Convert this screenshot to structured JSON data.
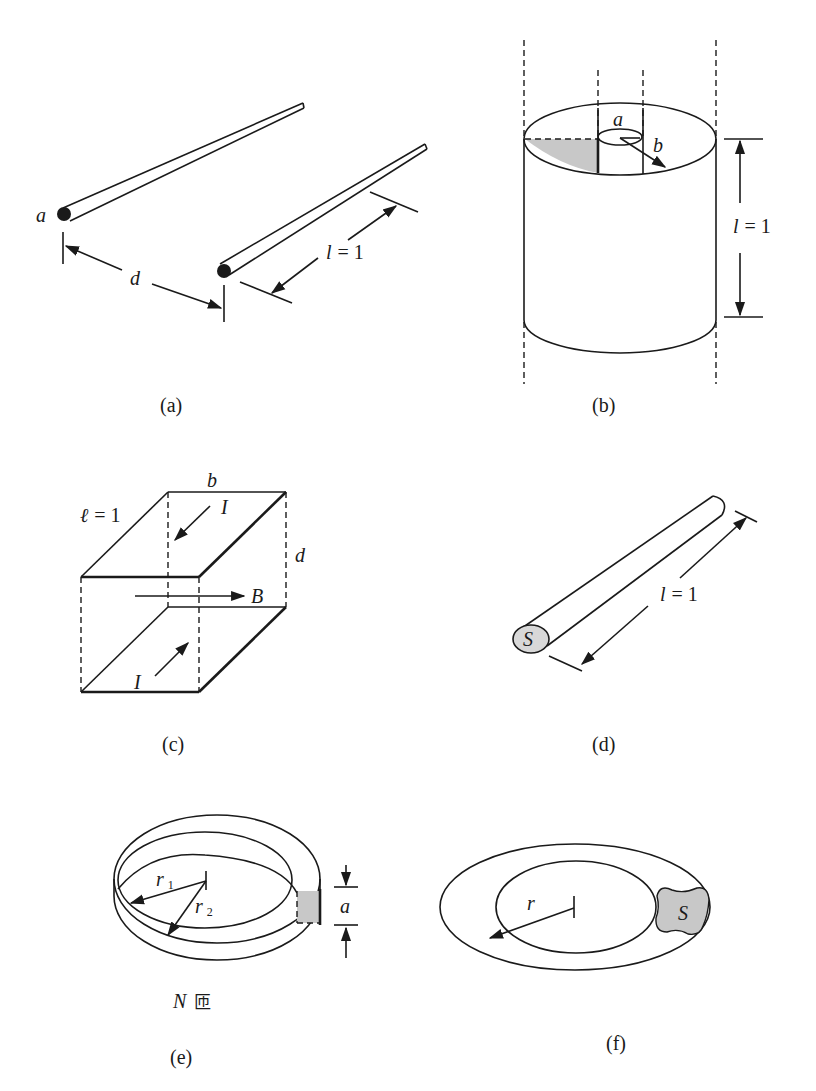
{
  "figure": {
    "panels": [
      {
        "id": "a",
        "caption": "(a)",
        "description": "Two parallel wires of radius a separated by distance d, length l = 1",
        "labels": {
          "radius": "a",
          "separation": "d",
          "length_var": "l",
          "length_eq": "= 1"
        }
      },
      {
        "id": "b",
        "caption": "(b)",
        "description": "Coaxial cylinder with inner radius a, outer radius b, length l = 1",
        "labels": {
          "inner_radius": "a",
          "outer_radius": "b",
          "length_var": "l",
          "length_eq": "= 1"
        }
      },
      {
        "id": "c",
        "caption": "(c)",
        "description": "Parallel plate line, width b, separation d, length ℓ = 1, currents I, field B",
        "labels": {
          "length_var": "ℓ",
          "length_eq": "= 1",
          "width": "b",
          "separation": "d",
          "current_top": "I",
          "current_bottom": "I",
          "field": "B"
        }
      },
      {
        "id": "d",
        "caption": "(d)",
        "description": "Wire with cross section S and length l = 1",
        "labels": {
          "cross_section": "S",
          "length_var": "l",
          "length_eq": "= 1"
        }
      },
      {
        "id": "e",
        "caption": "(e)",
        "description": "Toroid with inner radius r1, outer radius r2, height a, N turns",
        "labels": {
          "r1_base": "r",
          "r1_sub": "1",
          "r2_base": "r",
          "r2_sub": "2",
          "height": "a",
          "turns_var": "N",
          "turns_unit": "匝"
        }
      },
      {
        "id": "f",
        "caption": "(f)",
        "description": "Toroid with radius r and cross section S",
        "labels": {
          "radius": "r",
          "cross_section": "S"
        }
      }
    ]
  }
}
